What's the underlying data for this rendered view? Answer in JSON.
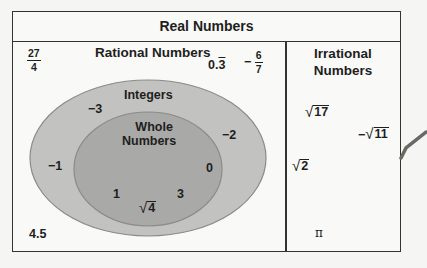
{
  "title": "Real Numbers",
  "rational": {
    "heading": "Rational Numbers",
    "outside_items": {
      "frac_27_4": {
        "num": "27",
        "den": "4"
      },
      "repeating": {
        "int": "0.",
        "rep": "3"
      },
      "neg_frac": {
        "sign": "−",
        "num": "6",
        "den": "7"
      },
      "decimal": "4.5"
    },
    "integers": {
      "label": "Integers",
      "items": [
        "−3",
        "−2",
        "−1"
      ]
    },
    "whole_numbers": {
      "label_line1": "Whole",
      "label_line2": "Numbers",
      "items": [
        "0",
        "1",
        "3"
      ],
      "sqrt4": "4"
    }
  },
  "irrational": {
    "heading_line1": "Irrational",
    "heading_line2": "Numbers",
    "sqrt17": "17",
    "neg_sqrt11": {
      "sign": "−",
      "arg": "11"
    },
    "sqrt2": "2",
    "pi": "π"
  },
  "colors": {
    "integers_fill": "#c2c2c0",
    "whole_fill": "#a9a9a7",
    "ellipse_stroke": "#8a8a88"
  }
}
